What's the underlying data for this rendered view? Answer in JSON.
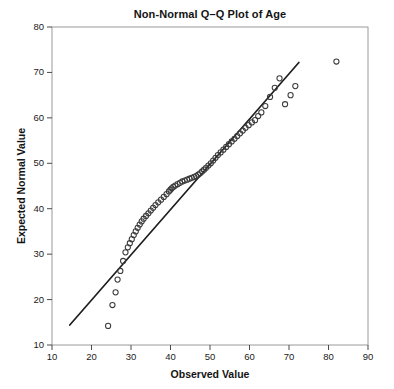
{
  "chart_data": {
    "type": "scatter",
    "title": "Non-Normal Q–Q Plot of Age",
    "xlabel": "Observed Value",
    "ylabel": "Expected Normal Value",
    "xlim": [
      10,
      90
    ],
    "ylim": [
      10,
      80
    ],
    "xticks": [
      10,
      20,
      30,
      40,
      50,
      60,
      70,
      80,
      90
    ],
    "yticks": [
      10,
      20,
      30,
      40,
      50,
      60,
      70,
      80
    ],
    "grid": false,
    "legend": null,
    "marker": "open-circle",
    "marker_color": "#3c3c3c",
    "line_color": "#1e1e1e",
    "series": [
      {
        "name": "Q-Q points",
        "x": [
          24.2,
          25.3,
          26.1,
          26.6,
          27.3,
          28.0,
          28.6,
          29.2,
          29.7,
          30.2,
          30.7,
          31.2,
          31.7,
          32.2,
          32.7,
          33.2,
          33.8,
          34.4,
          35.0,
          35.6,
          36.2,
          36.9,
          37.6,
          38.3,
          39.0,
          39.6,
          40.0,
          40.3,
          40.7,
          41.2,
          41.8,
          42.4,
          43.0,
          43.6,
          44.2,
          44.8,
          45.4,
          46.0,
          46.5,
          47.0,
          47.5,
          48.0,
          48.5,
          49.0,
          49.6,
          50.2,
          50.8,
          51.4,
          52.0,
          52.7,
          53.4,
          54.1,
          54.8,
          55.5,
          56.2,
          56.9,
          57.6,
          58.3,
          59.0,
          59.8,
          60.6,
          61.4,
          62.2,
          63.0,
          64.0,
          65.2,
          66.4,
          67.6,
          69.0,
          70.4,
          71.6,
          82.0
        ],
        "y": [
          14.2,
          18.8,
          21.6,
          24.4,
          26.3,
          28.5,
          30.4,
          31.5,
          32.4,
          33.3,
          34.2,
          35.0,
          35.8,
          36.5,
          37.2,
          37.8,
          38.4,
          39.0,
          39.6,
          40.2,
          40.8,
          41.4,
          42.0,
          42.6,
          43.2,
          43.8,
          44.2,
          44.5,
          44.8,
          45.1,
          45.4,
          45.7,
          46.0,
          46.2,
          46.4,
          46.6,
          46.8,
          47.0,
          47.2,
          47.5,
          47.8,
          48.2,
          48.6,
          49.0,
          49.5,
          50.0,
          50.6,
          51.2,
          51.8,
          52.4,
          53.0,
          53.6,
          54.2,
          54.8,
          55.4,
          56.0,
          56.6,
          57.2,
          57.8,
          58.4,
          59.0,
          59.5,
          60.4,
          61.2,
          62.6,
          64.6,
          66.6,
          68.7,
          63.0,
          65.0,
          67.0,
          72.4
        ]
      }
    ],
    "reference_line": {
      "name": "normal reference line",
      "x_start": 14.5,
      "y_start": 14.4,
      "x_end": 72.5,
      "y_end": 72.2
    }
  }
}
